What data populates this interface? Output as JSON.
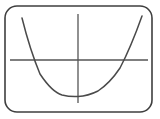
{
  "figure": {
    "name": "parabola-graph-figure",
    "width": 160,
    "height": 119,
    "background_color": "#ffffff",
    "stroke_color": "#4a4a4a",
    "frame_stroke_color": "#3f3f3f",
    "axis_stroke_color": "#555555"
  },
  "frame": {
    "label": "rounded-rectangle-border",
    "x": 5,
    "y": 6,
    "width": 147,
    "height": 106,
    "corner_radius": 12,
    "stroke_width": 1.6,
    "color": "#3f3f3f"
  },
  "axes": {
    "x_axis": {
      "label": "horizontal-axis",
      "y": 60,
      "x_start": 10,
      "x_end": 148,
      "stroke_width": 1.3,
      "color": "#555555"
    },
    "y_axis": {
      "label": "vertical-axis",
      "x": 78,
      "y_start": 14,
      "y_end": 103,
      "stroke_width": 1.3,
      "color": "#555555"
    },
    "origin": {
      "label": "axis-intersection",
      "x": 78,
      "y": 60
    }
  },
  "chart_data": {
    "type": "line",
    "title": "",
    "subtitle": "",
    "xlabel": "",
    "ylabel": "",
    "grid": false,
    "legend_position": "none",
    "curve_name": "upward-opening-parabola",
    "vertex": {
      "x": 78,
      "y": 96
    },
    "x_intercepts_px": [
      31,
      125
    ],
    "endpoints_px": [
      {
        "x": 22,
        "y": 18
      },
      {
        "x": 142,
        "y": 16
      }
    ],
    "x": [
      22,
      31,
      40,
      50,
      60,
      70,
      78,
      86,
      96,
      106,
      116,
      125,
      134,
      142
    ],
    "y": [
      18,
      60,
      75,
      86,
      92,
      95,
      96,
      95,
      92,
      85,
      73,
      60,
      40,
      16
    ],
    "path": "M 22,18 Q 30,50 40,74 Q 52,92 62,95 Q 70,97 78,96.5 Q 88,96 98,91 Q 110,83 120,68 Q 131,47 142,16",
    "stroke_width": 1.5,
    "color": "#4a4a4a",
    "xlim": [
      5,
      152
    ],
    "ylim": [
      6,
      112
    ],
    "annotations": [],
    "tick_labels": {
      "x": [],
      "y": []
    },
    "series": [
      {
        "name": "upward-opening-parabola",
        "values": [
          18,
          60,
          75,
          86,
          92,
          95,
          96,
          95,
          92,
          85,
          73,
          60,
          40,
          16
        ]
      }
    ]
  }
}
